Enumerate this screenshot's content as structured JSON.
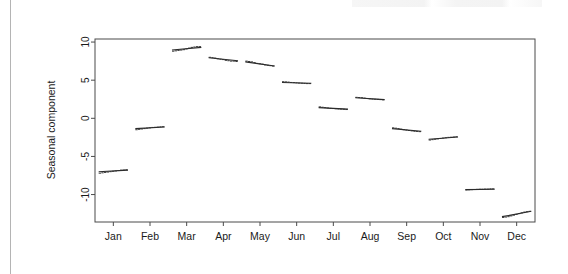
{
  "figure": {
    "kind": "monthplot",
    "background_color": "#ffffff",
    "page_edge_color": "#b4b4b4"
  },
  "chart_data": {
    "type": "line",
    "title": "",
    "subtitle": "",
    "xlabel": "",
    "ylabel": "Seasonal component",
    "categories": [
      "Jan",
      "Feb",
      "Mar",
      "Apr",
      "May",
      "Jun",
      "Jul",
      "Aug",
      "Sep",
      "Oct",
      "Nov",
      "Dec"
    ],
    "xtick_labels": [
      "Jan",
      "Feb",
      "Mar",
      "Apr",
      "May",
      "Jun",
      "Jul",
      "Aug",
      "Sep",
      "Oct",
      "Nov",
      "Dec"
    ],
    "ytick_labels": [
      "10",
      "5",
      "0",
      "-5",
      "-10"
    ],
    "ytick_values": [
      10,
      5,
      0,
      -5,
      -10
    ],
    "ylim": [
      -13.6,
      10.4
    ],
    "xlim": [
      0.5,
      12.5
    ],
    "grid": false,
    "legend": null,
    "legend_position": "none",
    "series": [
      {
        "name": "Seasonal component mean",
        "values": [
          -6.9,
          -1.25,
          9.1,
          7.8,
          7.2,
          4.65,
          1.3,
          2.55,
          -1.55,
          -2.6,
          -9.3,
          -12.5
        ]
      }
    ],
    "month_segments": [
      {
        "month": "Jan",
        "mean_start": -7.0,
        "mean_end": -6.8,
        "values": [
          -7.2,
          -7.15,
          -7.1,
          -7.05,
          -7.0,
          -6.95,
          -6.9,
          -6.85,
          -6.8,
          -6.78,
          -6.75
        ]
      },
      {
        "month": "Feb",
        "mean_start": -1.35,
        "mean_end": -1.15,
        "values": [
          -1.5,
          -1.45,
          -1.4,
          -1.35,
          -1.3,
          -1.25,
          -1.2,
          -1.18,
          -1.15,
          -1.12,
          -1.1
        ]
      },
      {
        "month": "Mar",
        "mean_start": 8.95,
        "mean_end": 9.3,
        "values": [
          8.8,
          8.85,
          8.9,
          8.95,
          9.0,
          9.1,
          9.2,
          9.3,
          9.35,
          9.4,
          9.4
        ]
      },
      {
        "month": "Apr",
        "mean_start": 7.95,
        "mean_end": 7.55,
        "values": [
          8.0,
          7.95,
          7.9,
          7.8,
          7.75,
          7.7,
          7.6,
          7.55,
          7.5,
          7.5,
          7.45
        ]
      },
      {
        "month": "May",
        "mean_start": 7.4,
        "mean_end": 6.85,
        "values": [
          7.5,
          7.45,
          7.4,
          7.3,
          7.2,
          7.15,
          7.1,
          7.0,
          6.95,
          6.9,
          6.85
        ]
      },
      {
        "month": "Jun",
        "mean_start": 4.7,
        "mean_end": 4.6,
        "values": [
          4.8,
          4.78,
          4.75,
          4.7,
          4.68,
          4.65,
          4.62,
          4.6,
          4.58,
          4.55,
          4.55
        ]
      },
      {
        "month": "Jul",
        "mean_start": 1.4,
        "mean_end": 1.2,
        "values": [
          1.5,
          1.45,
          1.4,
          1.35,
          1.3,
          1.28,
          1.25,
          1.22,
          1.2,
          1.18,
          1.15
        ]
      },
      {
        "month": "Aug",
        "mean_start": 2.7,
        "mean_end": 2.45,
        "values": [
          2.75,
          2.72,
          2.7,
          2.65,
          2.6,
          2.55,
          2.52,
          2.5,
          2.48,
          2.45,
          2.42
        ]
      },
      {
        "month": "Sep",
        "mean_start": -1.35,
        "mean_end": -1.7,
        "values": [
          -1.25,
          -1.3,
          -1.35,
          -1.42,
          -1.5,
          -1.55,
          -1.6,
          -1.65,
          -1.7,
          -1.72,
          -1.75
        ]
      },
      {
        "month": "Oct",
        "mean_start": -2.75,
        "mean_end": -2.45,
        "values": [
          -2.85,
          -2.8,
          -2.75,
          -2.7,
          -2.65,
          -2.6,
          -2.55,
          -2.5,
          -2.48,
          -2.45,
          -2.42
        ]
      },
      {
        "month": "Nov",
        "mean_start": -9.35,
        "mean_end": -9.3,
        "values": [
          -9.4,
          -9.38,
          -9.36,
          -9.34,
          -9.32,
          -9.3,
          -9.3,
          -9.28,
          -9.28,
          -9.25,
          -9.25
        ]
      },
      {
        "month": "Dec",
        "mean_start": -12.9,
        "mean_end": -12.2,
        "values": [
          -13.0,
          -12.95,
          -12.9,
          -12.8,
          -12.7,
          -12.6,
          -12.5,
          -12.4,
          -12.3,
          -12.25,
          -12.2
        ]
      }
    ]
  }
}
